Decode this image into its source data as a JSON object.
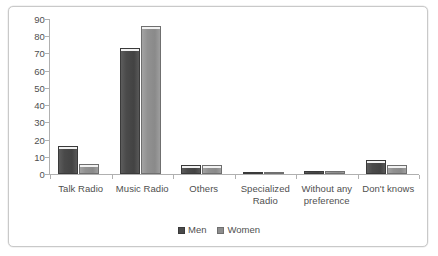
{
  "chart_data": {
    "type": "bar",
    "title": "",
    "subtitle": "",
    "xlabel": "",
    "ylabel": "",
    "ylim": [
      0,
      90
    ],
    "ytick_step": 10,
    "yticks": [
      "90",
      "80",
      "70",
      "60",
      "50",
      "40",
      "30",
      "20",
      "10",
      "0"
    ],
    "grid": false,
    "legend_position": "bottom",
    "categories": [
      "Talk Radio",
      "Music Radio",
      "Others",
      "Specialized Radio",
      "Without any preference",
      "Don't knows"
    ],
    "category_lines": [
      [
        "Talk Radio"
      ],
      [
        "Music Radio"
      ],
      [
        "Others"
      ],
      [
        "Specialized",
        "Radio"
      ],
      [
        "Without any",
        "preference"
      ],
      [
        "Don't knows"
      ]
    ],
    "series": [
      {
        "name": "Men",
        "color": "#4a4a4a",
        "values": [
          16,
          73,
          5,
          1,
          2,
          8
        ]
      },
      {
        "name": "Women",
        "color": "#8d8d8d",
        "values": [
          6,
          86,
          5,
          1,
          2,
          5
        ]
      }
    ]
  },
  "legend": {
    "items": [
      {
        "label": "Men"
      },
      {
        "label": "Women"
      }
    ]
  }
}
